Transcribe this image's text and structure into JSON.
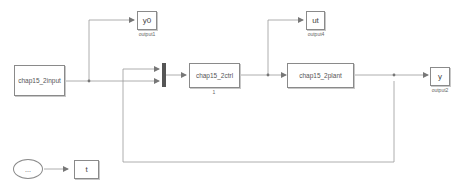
{
  "diagram": {
    "type": "simulink-block-diagram",
    "colors": {
      "line": "#9a9a9a",
      "block_border": "#8a8a8a",
      "mux_bar": "#555555",
      "background": "#ffffff"
    },
    "blocks": {
      "input": {
        "label": "chap15_2input"
      },
      "ctrl": {
        "label": "chap15_2ctrl",
        "sublabel": "1"
      },
      "plant": {
        "label": "chap15_2plant"
      },
      "out_y0": {
        "label": "y0",
        "sublabel": "output1"
      },
      "out_ut": {
        "label": "ut",
        "sublabel": "output4"
      },
      "out_y": {
        "label": "y",
        "sublabel": "output2"
      },
      "clock": {
        "label": "..."
      },
      "out_t": {
        "label": "t"
      }
    }
  }
}
